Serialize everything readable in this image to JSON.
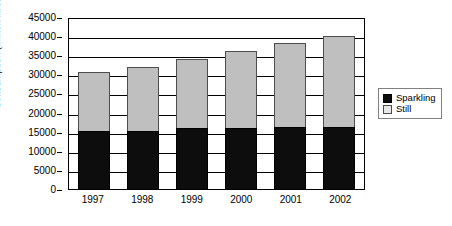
{
  "chart_data": {
    "type": "bar",
    "stacked": true,
    "title": "",
    "xlabel": "",
    "ylabel": "Consumption (million litres)",
    "categories": [
      "1997",
      "1998",
      "1999",
      "2000",
      "2001",
      "2002"
    ],
    "series": [
      {
        "name": "Sparkling",
        "color": "#0d0d0d",
        "values": [
          15200,
          15200,
          16000,
          16000,
          16200,
          16200
        ]
      },
      {
        "name": "Still",
        "color": "#bfbfbf",
        "values": [
          15300,
          16800,
          18000,
          20000,
          22000,
          23800
        ]
      }
    ],
    "totals": [
      30500,
      32000,
      34000,
      36000,
      38200,
      40000
    ],
    "ylim": [
      0,
      45000
    ],
    "ytick_step": 5000,
    "yticks": [
      "45000",
      "40000",
      "35000",
      "30000",
      "25000",
      "20000",
      "15000",
      "10000",
      "5000",
      "0"
    ],
    "ytick_values": [
      45000,
      40000,
      35000,
      30000,
      25000,
      20000,
      15000,
      10000,
      5000,
      0
    ],
    "grid": true,
    "legend_position": "right"
  },
  "legend": {
    "items": [
      {
        "label": "Sparkling",
        "swatch": "sparkling-swatch-icon"
      },
      {
        "label": "Still",
        "swatch": "still-swatch-icon"
      }
    ]
  }
}
